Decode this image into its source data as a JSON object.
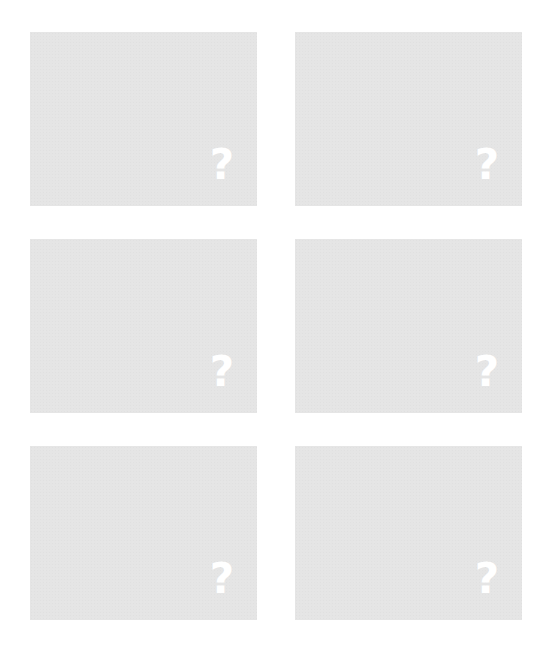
{
  "tiles": [
    {
      "label": "?",
      "state": "hidden"
    },
    {
      "label": "?",
      "state": "hidden"
    },
    {
      "label": "?",
      "state": "hidden"
    },
    {
      "label": "?",
      "state": "hidden"
    },
    {
      "label": "?",
      "state": "hidden"
    },
    {
      "label": "?",
      "state": "hidden"
    }
  ],
  "colors": {
    "tile_background": "#e5e5e5",
    "icon": "#ffffff",
    "page_background": "#ffffff"
  }
}
